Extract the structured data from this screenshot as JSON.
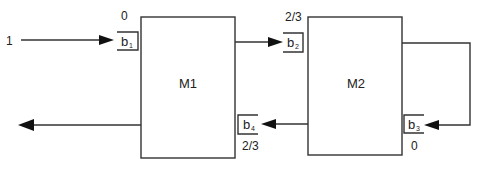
{
  "diagram": {
    "blocks": [
      {
        "id": "M1",
        "label": "M1"
      },
      {
        "id": "M2",
        "label": "M2"
      }
    ],
    "buffers": [
      {
        "id": "b1",
        "label": "b",
        "subscript": "1",
        "value": "0",
        "block": "M1"
      },
      {
        "id": "b2",
        "label": "b",
        "subscript": "2",
        "value": "2/3",
        "block": "M2"
      },
      {
        "id": "b3",
        "label": "b",
        "subscript": "3",
        "value": "0",
        "block": "M2"
      },
      {
        "id": "b4",
        "label": "b",
        "subscript": "4",
        "value": "2/3",
        "block": "M1"
      }
    ],
    "input": {
      "label": "1"
    },
    "edges": [
      {
        "from": "input",
        "to": "b1"
      },
      {
        "from": "M1",
        "to": "b2"
      },
      {
        "from": "M2",
        "to": "b3",
        "style": "feedback-loop"
      },
      {
        "from": "M2",
        "to": "b4"
      },
      {
        "from": "M1",
        "to": "output"
      }
    ]
  }
}
